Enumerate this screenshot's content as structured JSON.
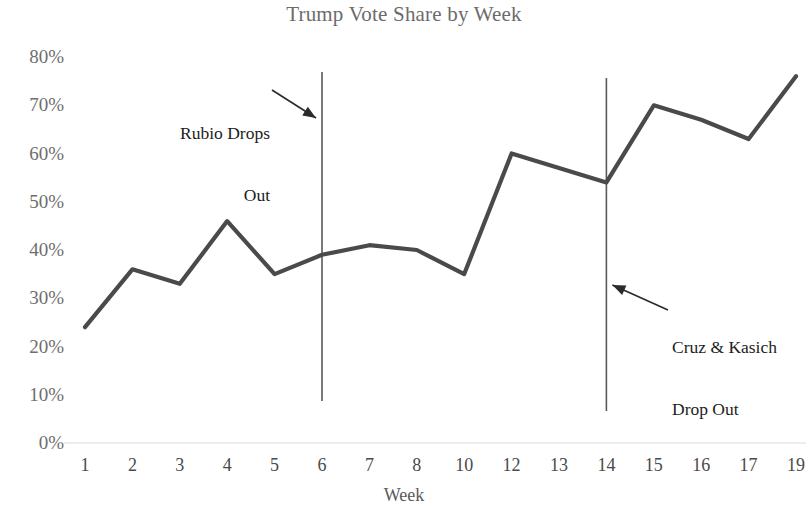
{
  "chart_data": {
    "type": "line",
    "title": "Trump Vote Share by Week",
    "xlabel": "Week",
    "ylabel": "",
    "categories": [
      "1",
      "2",
      "3",
      "4",
      "5",
      "6",
      "7",
      "8",
      "10",
      "12",
      "13",
      "14",
      "15",
      "16",
      "17",
      "19"
    ],
    "values": [
      24,
      36,
      33,
      46,
      35,
      39,
      41,
      40,
      35,
      60,
      57,
      54,
      70,
      67,
      63,
      76
    ],
    "series": [
      {
        "name": "Trump Vote Share",
        "values": [
          24,
          36,
          33,
          46,
          35,
          39,
          41,
          40,
          35,
          60,
          57,
          54,
          70,
          67,
          63,
          76
        ]
      }
    ],
    "ylim": [
      0,
      80
    ],
    "y_ticks": [
      0,
      10,
      20,
      30,
      40,
      50,
      60,
      70,
      80
    ],
    "y_tick_labels": [
      "0%",
      "10%",
      "20%",
      "30%",
      "40%",
      "50%",
      "60%",
      "70%",
      "80%"
    ],
    "grid": false,
    "legend": "none",
    "line_color": "#4a4a4a",
    "title_color": "#6b6b6b",
    "axis_label_color": "#6e6e6e",
    "annotations": [
      {
        "id": "rubio",
        "line1": "Rubio Drops",
        "line2": "Out",
        "at_week": "6",
        "marker": "vertical-line",
        "arrow": "points-right-down"
      },
      {
        "id": "cruz-kasich",
        "line1": "Cruz & Kasich",
        "line2": "Drop Out",
        "at_week": "14",
        "marker": "vertical-line",
        "arrow": "points-left-up"
      }
    ]
  }
}
